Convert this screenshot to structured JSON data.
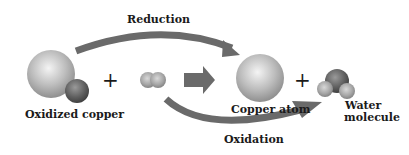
{
  "diagram": {
    "labels": {
      "reduction": "Reduction",
      "oxidation": "Oxidation",
      "oxidized_copper": "Oxidized copper",
      "copper_atom": "Copper atom",
      "water_line1": "Water",
      "water_line2": "molecule"
    },
    "operators": {
      "plus": "+"
    },
    "nodes": [
      {
        "id": "oxidized-copper",
        "label": "Oxidized copper",
        "parts": [
          "copper",
          "oxygen"
        ]
      },
      {
        "id": "hydrogen-molecule",
        "label": "",
        "parts": [
          "hydrogen",
          "hydrogen"
        ]
      },
      {
        "id": "copper-atom",
        "label": "Copper atom",
        "parts": [
          "copper"
        ]
      },
      {
        "id": "water-molecule",
        "label": "Water molecule",
        "parts": [
          "oxygen",
          "hydrogen",
          "hydrogen"
        ]
      }
    ],
    "edges": [
      {
        "from": "oxidized-copper",
        "to": "copper-atom",
        "label": "Reduction"
      },
      {
        "from": "hydrogen-molecule",
        "to": "water-molecule",
        "label": "Oxidation"
      },
      {
        "from": "reactants",
        "to": "products",
        "label": ""
      }
    ],
    "colors": {
      "arrow": "#6a6a6a",
      "copper_light": "#e8e8e8",
      "copper_dark": "#8c8c8c",
      "oxygen_dark": "#4a4a4a",
      "text": "#1a1a1a"
    }
  }
}
